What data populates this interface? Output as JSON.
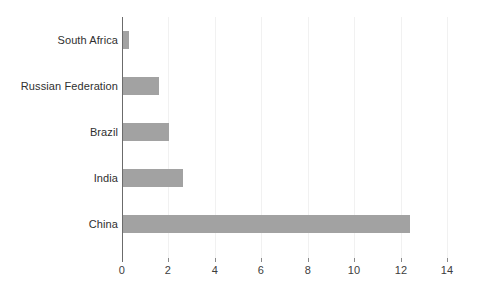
{
  "chart_data": {
    "type": "bar",
    "orientation": "horizontal",
    "title": "",
    "xlabel": "",
    "ylabel": "",
    "categories": [
      "China",
      "India",
      "Brazil",
      "Russian Federation",
      "South Africa"
    ],
    "values": [
      12.35,
      2.6,
      2.0,
      1.55,
      0.26
    ],
    "series": [
      {
        "name": "",
        "values": [
          12.35,
          2.6,
          2.0,
          1.55,
          0.26
        ]
      }
    ],
    "xlim": [
      0,
      14
    ],
    "xticks": [
      0,
      2,
      4,
      6,
      8,
      10,
      12,
      14
    ],
    "xtick_labels": [
      "0",
      "2",
      "4",
      "6",
      "8",
      "10",
      "12",
      "14"
    ],
    "grid": true,
    "grid_axis": "x",
    "legend": false,
    "legend_position": "none",
    "bar_color": "#a2a2a2",
    "axis_color": "#6b6b6b",
    "gridline_color": "#f1f1f1",
    "text_color": "#2f2f2f",
    "background_color": "#ffffff"
  }
}
